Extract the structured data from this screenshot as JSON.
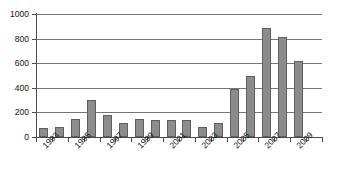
{
  "chart_data": {
    "type": "bar",
    "title": "",
    "subtitle": "",
    "xlabel": "",
    "ylabel": "",
    "legend": [],
    "grid": true,
    "legend_position": "none",
    "ylim": [
      0,
      1000
    ],
    "yticks": [
      0,
      200,
      400,
      600,
      800,
      1000
    ],
    "ytick_labels": [
      "0",
      "200",
      "400",
      "600",
      "800",
      "1000"
    ],
    "categories": [
      "1993",
      "1994",
      "1995",
      "1996",
      "1997",
      "1998",
      "1999",
      "2000",
      "2001",
      "2002",
      "2003",
      "2004",
      "2005",
      "2006",
      "2007",
      "2008",
      "2009"
    ],
    "visible_xtick_labels": [
      "1993",
      "1995",
      "1997",
      "1999",
      "2001",
      "2003",
      "2005",
      "2007",
      "2009"
    ],
    "values": [
      70,
      80,
      150,
      300,
      180,
      110,
      150,
      140,
      140,
      135,
      85,
      115,
      390,
      495,
      890,
      815,
      615
    ],
    "series": [
      {
        "name": "",
        "values": [
          70,
          80,
          150,
          300,
          180,
          110,
          150,
          140,
          140,
          135,
          85,
          115,
          390,
          495,
          890,
          815,
          615
        ]
      }
    ],
    "colors": {
      "bar_fill": "#8c8c8c",
      "bar_stroke": "#5e5e5e",
      "gridline": "#767676",
      "axis": "#4a4a4a",
      "background": "#ffffff",
      "text": "#111111"
    }
  }
}
